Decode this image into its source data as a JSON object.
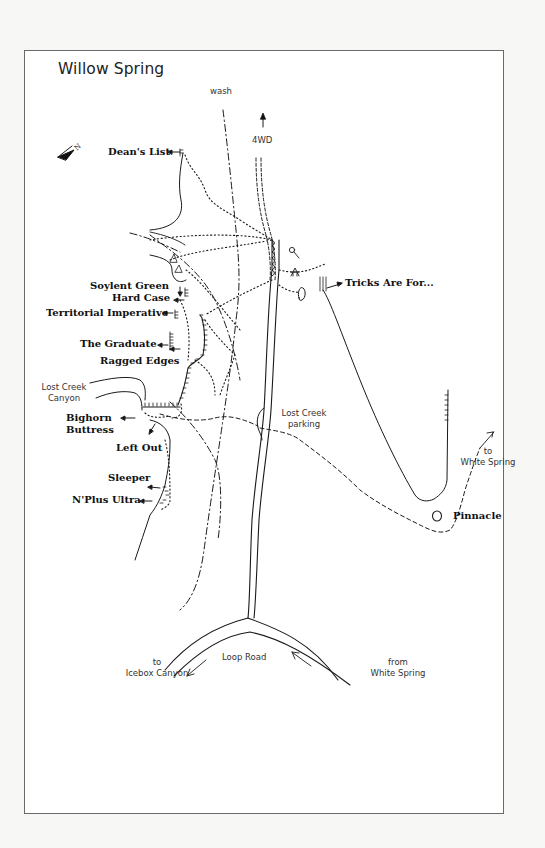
{
  "map": {
    "title": "Willow Spring",
    "compass": {
      "icon": "north-arrow-icon",
      "letter": "N"
    },
    "features": {
      "wash": "wash",
      "four_wd": "4WD",
      "lost_creek_canyon": [
        "Lost Creek",
        "Canyon"
      ],
      "lost_creek_parking": [
        "Lost Creek",
        "parking"
      ],
      "to_white_spring": [
        "to",
        "White Spring"
      ],
      "to_icebox_canyon": [
        "to",
        "Icebox Canyon"
      ],
      "loop_road": "Loop Road",
      "from_white_spring": [
        "from",
        "White Spring"
      ]
    },
    "routes": [
      {
        "name": "Dean's List"
      },
      {
        "name": "Tricks Are For..."
      },
      {
        "name": "Soylent Green"
      },
      {
        "name": "Hard Case"
      },
      {
        "name": "Territorial Imperative"
      },
      {
        "name": "The Graduate"
      },
      {
        "name": "Ragged Edges"
      },
      {
        "name": "Bighorn",
        "line2": "Buttress"
      },
      {
        "name": "Left Out"
      },
      {
        "name": "Sleeper"
      },
      {
        "name": "N'Plus Ultra"
      },
      {
        "name": "Pinnacle"
      }
    ],
    "legend_icons": [
      "cliff-hatch-icon",
      "trail-dotted-icon",
      "wash-dashdot-icon",
      "road-double-line-icon",
      "pinnacle-boulder-icon",
      "picnic-shelter-icon",
      "toilet-icon"
    ]
  }
}
